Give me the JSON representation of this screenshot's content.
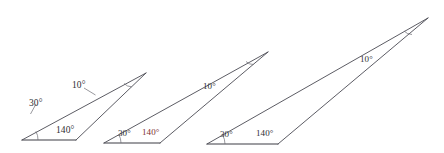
{
  "figure": {
    "type": "geometry-diagram",
    "background_color": "#ffffff",
    "line_color": "#4a4a52",
    "label_color": "#2e2e33",
    "accent_label_color": "#7d2f2f",
    "degree_symbol": "°",
    "triangles": [
      {
        "id": "triangle-1",
        "size_rank": "small",
        "vertices": {
          "left": [
            22,
            140
          ],
          "base_right": [
            76,
            140
          ],
          "apex": [
            146,
            73
          ]
        },
        "labels": {
          "angle_left": "30°",
          "angle_base_right": "140°",
          "angle_apex": "10°"
        },
        "label_positions": {
          "angle_left": [
            29,
            99
          ],
          "angle_base_right": [
            56,
            126
          ],
          "angle_apex": [
            72,
            81
          ]
        },
        "accent": {
          "angle_base_right": false
        }
      },
      {
        "id": "triangle-2",
        "size_rank": "medium",
        "vertices": {
          "left": [
            104,
            143
          ],
          "base_right": [
            160,
            143
          ],
          "apex": [
            268,
            52
          ]
        },
        "labels": {
          "angle_left": "30°",
          "angle_base_right": "140°",
          "angle_apex": "10°"
        },
        "label_positions": {
          "angle_left": [
            118,
            129
          ],
          "angle_base_right": [
            142,
            128
          ],
          "angle_apex": [
            203,
            82
          ]
        },
        "accent": {
          "angle_base_right": true
        }
      },
      {
        "id": "triangle-3",
        "size_rank": "large",
        "vertices": {
          "left": [
            207,
            144
          ],
          "base_right": [
            278,
            144
          ],
          "apex": [
            428,
            18
          ]
        },
        "labels": {
          "angle_left": "30°",
          "angle_base_right": "140°",
          "angle_apex": "10°"
        },
        "label_positions": {
          "angle_left": [
            220,
            130
          ],
          "angle_base_right": [
            256,
            129
          ],
          "angle_apex": [
            360,
            55
          ]
        },
        "accent": {
          "angle_base_right": false
        }
      }
    ]
  }
}
